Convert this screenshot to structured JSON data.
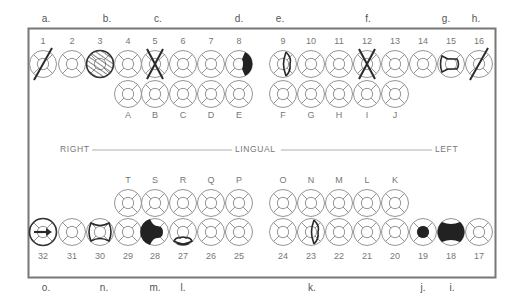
{
  "frame": {
    "x": 28,
    "y": 28,
    "width": 467,
    "height": 249,
    "color": "#777777"
  },
  "midline": {
    "right": "RIGHT",
    "center": "LINGUAL",
    "left": "LEFT"
  },
  "annotations_top": [
    {
      "label": "a.",
      "x": 46
    },
    {
      "label": "b.",
      "x": 107
    },
    {
      "label": "c.",
      "x": 158
    },
    {
      "label": "d.",
      "x": 239
    },
    {
      "label": "e.",
      "x": 280
    },
    {
      "label": "f.",
      "x": 368
    },
    {
      "label": "g.",
      "x": 446
    },
    {
      "label": "h.",
      "x": 476
    }
  ],
  "annotations_bottom": [
    {
      "label": "o.",
      "x": 46
    },
    {
      "label": "n.",
      "x": 104
    },
    {
      "label": "m.",
      "x": 155
    },
    {
      "label": "l.",
      "x": 183
    },
    {
      "label": "k.",
      "x": 312
    },
    {
      "label": "j.",
      "x": 423
    },
    {
      "label": "i.",
      "x": 452
    }
  ],
  "upper_permanent": [
    {
      "num": "1",
      "x": 43,
      "mark": "slash"
    },
    {
      "num": "2",
      "x": 72,
      "mark": "none"
    },
    {
      "num": "3",
      "x": 100,
      "mark": "hatched"
    },
    {
      "num": "4",
      "x": 128,
      "mark": "none"
    },
    {
      "num": "5",
      "x": 155,
      "mark": "x"
    },
    {
      "num": "6",
      "x": 183,
      "mark": "none"
    },
    {
      "num": "7",
      "x": 211,
      "mark": "none"
    },
    {
      "num": "8",
      "x": 239,
      "mark": "fill-right"
    },
    {
      "num": "9",
      "x": 283,
      "mark": "outline-right"
    },
    {
      "num": "10",
      "x": 311,
      "mark": "none"
    },
    {
      "num": "11",
      "x": 339,
      "mark": "none"
    },
    {
      "num": "12",
      "x": 367,
      "mark": "x"
    },
    {
      "num": "13",
      "x": 395,
      "mark": "none"
    },
    {
      "num": "14",
      "x": 423,
      "mark": "none"
    },
    {
      "num": "15",
      "x": 451,
      "mark": "outline-mol"
    },
    {
      "num": "16",
      "x": 479,
      "mark": "slash"
    }
  ],
  "upper_primary": [
    {
      "letter": "A",
      "x": 128
    },
    {
      "letter": "B",
      "x": 155
    },
    {
      "letter": "C",
      "x": 183
    },
    {
      "letter": "D",
      "x": 211
    },
    {
      "letter": "E",
      "x": 239
    },
    {
      "letter": "F",
      "x": 283
    },
    {
      "letter": "G",
      "x": 311
    },
    {
      "letter": "H",
      "x": 339
    },
    {
      "letter": "I",
      "x": 367
    },
    {
      "letter": "J",
      "x": 395
    }
  ],
  "lower_primary": [
    {
      "letter": "T",
      "x": 128
    },
    {
      "letter": "S",
      "x": 155
    },
    {
      "letter": "R",
      "x": 183
    },
    {
      "letter": "Q",
      "x": 211
    },
    {
      "letter": "P",
      "x": 239
    },
    {
      "letter": "O",
      "x": 283
    },
    {
      "letter": "N",
      "x": 311
    },
    {
      "letter": "M",
      "x": 339
    },
    {
      "letter": "L",
      "x": 367
    },
    {
      "letter": "K",
      "x": 395
    }
  ],
  "lower_permanent": [
    {
      "num": "32",
      "x": 43,
      "mark": "arrow"
    },
    {
      "num": "31",
      "x": 72,
      "mark": "none"
    },
    {
      "num": "30",
      "x": 100,
      "mark": "outline-mod"
    },
    {
      "num": "29",
      "x": 128,
      "mark": "none"
    },
    {
      "num": "28",
      "x": 155,
      "mark": "fill-do"
    },
    {
      "num": "27",
      "x": 183,
      "mark": "outline-bottom"
    },
    {
      "num": "26",
      "x": 211,
      "mark": "none"
    },
    {
      "num": "25",
      "x": 239,
      "mark": "none"
    },
    {
      "num": "24",
      "x": 283,
      "mark": "none"
    },
    {
      "num": "23",
      "x": 311,
      "mark": "outline-right"
    },
    {
      "num": "22",
      "x": 339,
      "mark": "none"
    },
    {
      "num": "21",
      "x": 367,
      "mark": "none"
    },
    {
      "num": "20",
      "x": 395,
      "mark": "none"
    },
    {
      "num": "19",
      "x": 423,
      "mark": "fill-center"
    },
    {
      "num": "18",
      "x": 451,
      "mark": "fill-mod"
    },
    {
      "num": "17",
      "x": 479,
      "mark": "none"
    }
  ],
  "layout": {
    "tooth_radius": 13.5,
    "upper_row1_y": 64,
    "upper_row2_y": 94,
    "upper_num_y": 44,
    "upper_letter_y": 118,
    "lower_letter_y": 183,
    "lower_row1_y": 203,
    "lower_row2_y": 232,
    "lower_num_y": 259,
    "annotation_top_y": 22,
    "annotation_bottom_y": 291,
    "midline_y": 150
  }
}
